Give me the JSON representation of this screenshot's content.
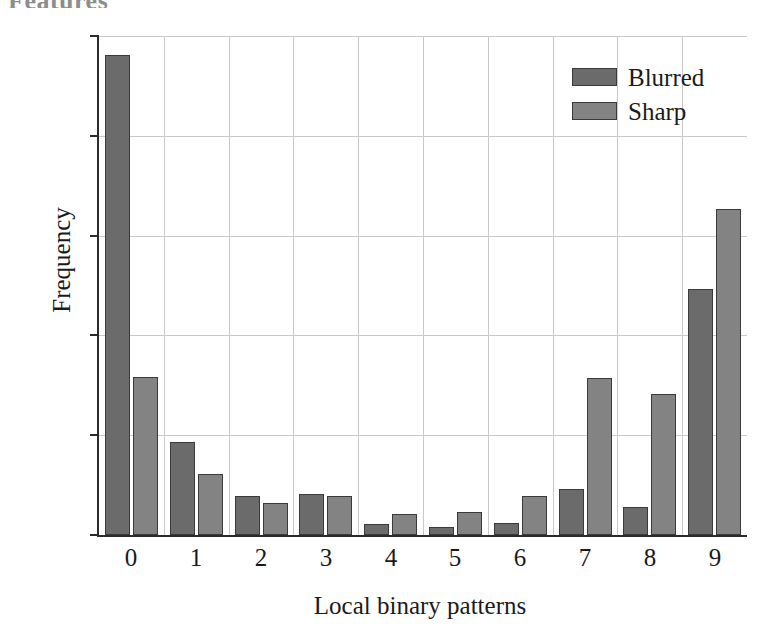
{
  "page": {
    "top_cut_text": "Features"
  },
  "legend": {
    "position": "top-right",
    "items": [
      {
        "label": "Blurred",
        "color": "#6b6b6b",
        "swatch_name": "legend-swatch-blurred"
      },
      {
        "label": "Sharp",
        "color": "#838383",
        "swatch_name": "legend-swatch-sharp"
      }
    ]
  },
  "axes": {
    "ylabel": "Frequency",
    "xlabel": "Local binary patterns",
    "yticks": [
      "0.0",
      "0.1",
      "0.2",
      "0.3",
      "0.4",
      "0.5"
    ],
    "xticks": [
      "0",
      "1",
      "2",
      "3",
      "4",
      "5",
      "6",
      "7",
      "8",
      "9"
    ]
  },
  "chart_data": {
    "type": "bar",
    "title": "",
    "xlabel": "Local binary patterns",
    "ylabel": "Frequency",
    "categories": [
      "0",
      "1",
      "2",
      "3",
      "4",
      "5",
      "6",
      "7",
      "8",
      "9"
    ],
    "series": [
      {
        "name": "Blurred",
        "color": "#6b6b6b",
        "values": [
          0.481,
          0.093,
          0.039,
          0.041,
          0.011,
          0.008,
          0.012,
          0.046,
          0.028,
          0.247
        ]
      },
      {
        "name": "Sharp",
        "color": "#838383",
        "values": [
          0.158,
          0.061,
          0.032,
          0.039,
          0.021,
          0.023,
          0.039,
          0.157,
          0.141,
          0.327
        ]
      }
    ],
    "ylim": [
      0.0,
      0.5
    ],
    "ytick_values": [
      0.0,
      0.1,
      0.2,
      0.3,
      0.4,
      0.5
    ],
    "grid": "both",
    "legend_position": "upper right"
  }
}
